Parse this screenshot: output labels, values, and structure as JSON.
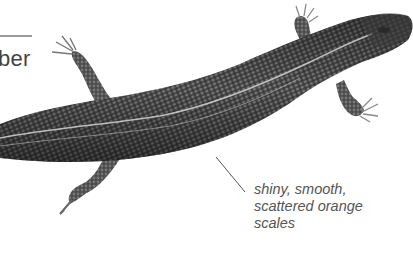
{
  "header": {
    "partial_label": "ber"
  },
  "illustration": {
    "subject": "skink-lizard-top-view",
    "style": "grayscale-scale-texture"
  },
  "callout": {
    "lines": [
      "shiny, smooth,",
      "scattered orange",
      "scales"
    ]
  },
  "colors": {
    "body_dark": "#2b2b2b",
    "body_mid": "#5a5a5a",
    "stripe": "#cfcfcf",
    "text": "#555555",
    "rule": "#9a9a9a"
  }
}
